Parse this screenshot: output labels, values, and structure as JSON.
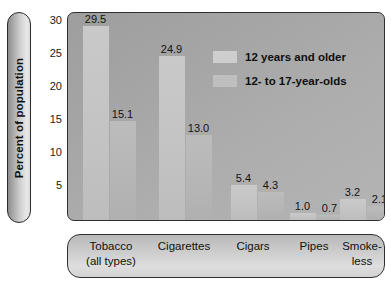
{
  "chart_data": {
    "type": "bar",
    "title": "",
    "xlabel": "",
    "ylabel": "Percent of population",
    "ylim": [
      0,
      31.5
    ],
    "yticks": [
      5,
      10,
      15,
      20,
      25,
      30
    ],
    "grid": false,
    "legend_position": "inside-top-right",
    "categories": [
      "Tobacco (all types)",
      "Cigarettes",
      "Cigars",
      "Pipes",
      "Smoke-less"
    ],
    "category_lines": [
      [
        "Tobacco",
        "(all types)"
      ],
      [
        "Cigarettes",
        ""
      ],
      [
        "Cigars",
        ""
      ],
      [
        "Pipes",
        ""
      ],
      [
        "Smoke-",
        "less"
      ]
    ],
    "series": [
      {
        "name": "12 years and older",
        "values": [
          29.5,
          24.9,
          5.4,
          1.0,
          3.2
        ],
        "labels": [
          "29.5",
          "24.9",
          "5.4",
          "1.0",
          "3.2"
        ],
        "color": "#c9c9c9"
      },
      {
        "name": "12- to 17-year-olds",
        "values": [
          15.1,
          13.0,
          4.3,
          0.7,
          2.1
        ],
        "labels": [
          "15.1",
          "13.0",
          "4.3",
          "0.7",
          "2.1"
        ],
        "color": "#bcbcbc"
      }
    ]
  },
  "ytick_labels": [
    "30",
    "25",
    "20",
    "15",
    "10",
    "5"
  ],
  "legend": {
    "items": [
      {
        "label": "12 years and older"
      },
      {
        "label": "12- to 17-year-olds"
      }
    ]
  },
  "colors": {
    "plot_background": "#a8a8a8",
    "border": "#2f2f2f",
    "series_1": "#c9c9c9",
    "series_2": "#bcbcbc",
    "text": "#111111"
  }
}
